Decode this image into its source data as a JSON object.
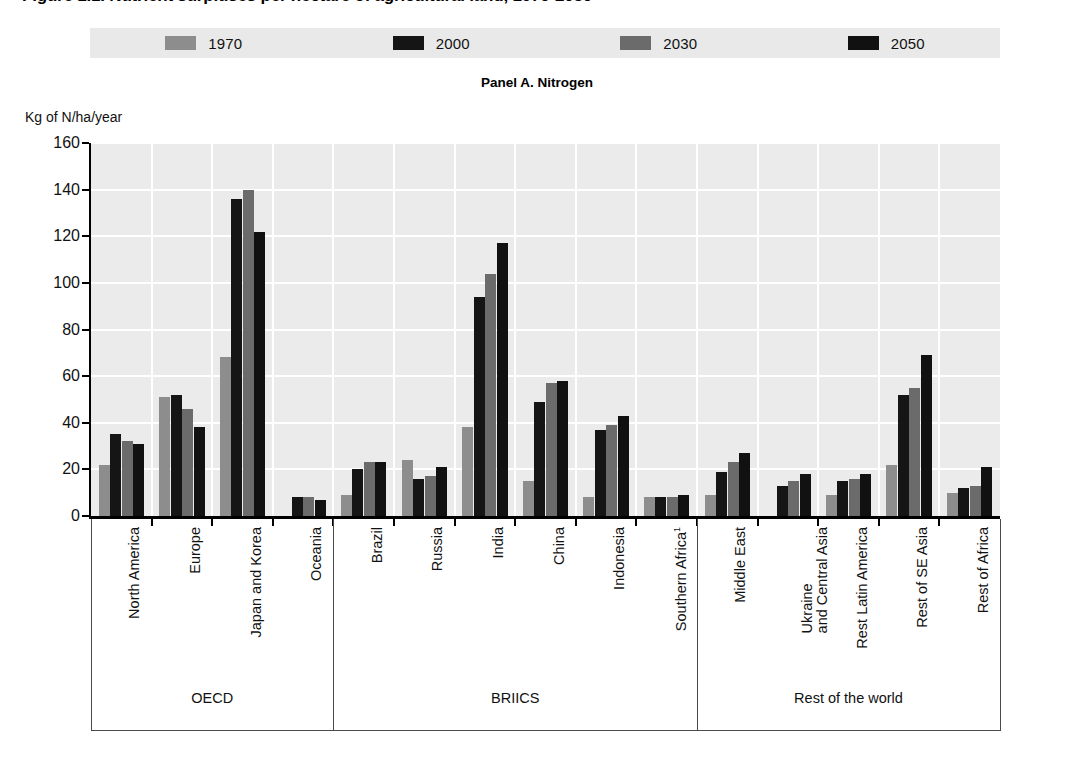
{
  "figure": {
    "title": "Figure 1.1. Nutrient surpluses per hectare of agricultural land, 1970-2050",
    "panel_caption": "Panel A. Nitrogen",
    "y_axis_unit": "Kg of N/ha/year"
  },
  "legend": {
    "items": [
      {
        "label": "1970",
        "color": "#8d8d8d"
      },
      {
        "label": "2000",
        "color": "#151515"
      },
      {
        "label": "2030",
        "color": "#6b6b6b"
      },
      {
        "label": "2050",
        "color": "#111111"
      }
    ]
  },
  "chart_data": {
    "type": "bar",
    "title": "Panel A. Nitrogen",
    "xlabel": "",
    "ylabel": "Kg of N/ha/year",
    "ylim": [
      0,
      160
    ],
    "ytick_step": 20,
    "yticks": [
      0,
      20,
      40,
      60,
      80,
      100,
      120,
      140,
      160
    ],
    "grid": true,
    "legend_position": "top",
    "categories": [
      "North America",
      "Europe",
      "Japan and Korea",
      "Oceania",
      "Brazil",
      "Russia",
      "India",
      "China",
      "Indonesia",
      "Southern Africa",
      "Middle East",
      "Ukraine and Central Asia",
      "Rest Latin America",
      "Rest of SE Asia",
      "Rest of Africa"
    ],
    "series": [
      {
        "name": "1970",
        "color": "#8d8d8d",
        "values": [
          22,
          51,
          68,
          0,
          9,
          24,
          38,
          15,
          8,
          8,
          9,
          0,
          9,
          22,
          10
        ]
      },
      {
        "name": "2000",
        "color": "#151515",
        "values": [
          35,
          52,
          136,
          8,
          20,
          16,
          94,
          49,
          37,
          8,
          19,
          13,
          15,
          52,
          12
        ]
      },
      {
        "name": "2030",
        "color": "#6b6b6b",
        "values": [
          32,
          46,
          140,
          8,
          23,
          17,
          104,
          57,
          39,
          8,
          23,
          15,
          16,
          55,
          13
        ]
      },
      {
        "name": "2050",
        "color": "#111111",
        "values": [
          31,
          38,
          122,
          7,
          23,
          21,
          117,
          58,
          43,
          9,
          27,
          18,
          18,
          69,
          21
        ]
      }
    ]
  },
  "x_axis": {
    "categories": [
      {
        "line1": "North America",
        "line2": ""
      },
      {
        "line1": "Europe",
        "line2": ""
      },
      {
        "line1": "Japan and Korea",
        "line2": ""
      },
      {
        "line1": "Oceania",
        "line2": ""
      },
      {
        "line1": "Brazil",
        "line2": ""
      },
      {
        "line1": "Russia",
        "line2": ""
      },
      {
        "line1": "India",
        "line2": ""
      },
      {
        "line1": "China",
        "line2": ""
      },
      {
        "line1": "Indonesia",
        "line2": ""
      },
      {
        "line1": "Southern Africa",
        "line2": "",
        "superscript": "1"
      },
      {
        "line1": "Middle East",
        "line2": ""
      },
      {
        "line1": "Ukraine",
        "line2": "and Central Asia"
      },
      {
        "line1": "Rest Latin America",
        "line2": ""
      },
      {
        "line1": "Rest of SE Asia",
        "line2": ""
      },
      {
        "line1": "Rest of Africa",
        "line2": ""
      }
    ]
  },
  "groups": [
    {
      "label": "OECD",
      "count": 4
    },
    {
      "label": "BRIICS",
      "count": 6
    },
    {
      "label": "Rest of the world",
      "count": 5
    }
  ],
  "colors": {
    "plot_background": "#ebebeb",
    "gridline": "#ffffff",
    "axis": "#000000",
    "legend_background": "#e9e9e9"
  }
}
